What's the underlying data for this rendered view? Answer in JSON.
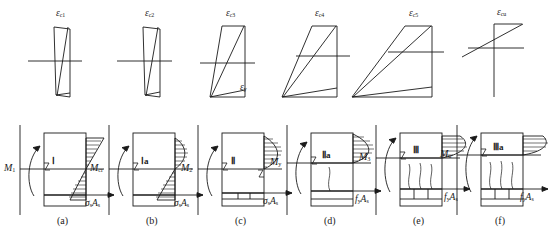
{
  "figure": {
    "stroke_color": "#1a1a1a",
    "panel_count": 6
  },
  "strain_diagrams": [
    {
      "id": "s1",
      "label": "ε",
      "sub": "c1",
      "stage": "uncracked elastic"
    },
    {
      "id": "s2",
      "label": "ε",
      "sub": "c2",
      "stage": "cracking imminent"
    },
    {
      "id": "s3",
      "label": "ε",
      "sub": "c3",
      "stage": "cracked elastic"
    },
    {
      "id": "s4",
      "label": "ε",
      "sub": "c4",
      "stage": "steel at yield"
    },
    {
      "id": "s5",
      "label": "ε",
      "sub": "c5",
      "stage": "post yield"
    },
    {
      "id": "s6",
      "label": "ε",
      "sub": "cu",
      "stage": "ultimate"
    }
  ],
  "strain_extra_labels": [
    {
      "id": "ey",
      "label": "ε",
      "sub": "y",
      "panel": 4
    }
  ],
  "panels": [
    {
      "key": "a",
      "caption": "(a)",
      "moment": "M",
      "moment_sub": "1",
      "roman": "Ⅰ",
      "resultant": "σ",
      "resultant_sub": "s",
      "resultant_tail": "A",
      "resultant_tail_sub": "s",
      "cracks": 0
    },
    {
      "key": "b",
      "caption": "(b)",
      "moment": "M",
      "moment_sub": "cr",
      "roman": "Ⅰa",
      "resultant": "σ",
      "resultant_sub": "s",
      "resultant_tail": "A",
      "resultant_tail_sub": "s",
      "cracks": 0
    },
    {
      "key": "c",
      "caption": "(c)",
      "moment": "M",
      "moment_sub": "2",
      "roman": "Ⅱ",
      "resultant": "σ",
      "resultant_sub": "s",
      "resultant_tail": "A",
      "resultant_tail_sub": "s",
      "cracks": 0
    },
    {
      "key": "d",
      "caption": "(d)",
      "moment": "M",
      "moment_sub": "y",
      "roman": "Ⅱa",
      "resultant": "f",
      "resultant_sub": "y",
      "resultant_tail": "A",
      "resultant_tail_sub": "s",
      "cracks": 1
    },
    {
      "key": "e",
      "caption": "(e)",
      "moment": "M",
      "moment_sub": "3",
      "roman": "Ⅲ",
      "resultant": "f",
      "resultant_sub": "y",
      "resultant_tail": "A",
      "resultant_tail_sub": "s",
      "cracks": 3
    },
    {
      "key": "f",
      "caption": "(f)",
      "moment": "M",
      "moment_sub": "u",
      "roman": "Ⅲa",
      "resultant": "f",
      "resultant_sub": "y",
      "resultant_tail": "A",
      "resultant_tail_sub": "s",
      "cracks": 3
    }
  ]
}
